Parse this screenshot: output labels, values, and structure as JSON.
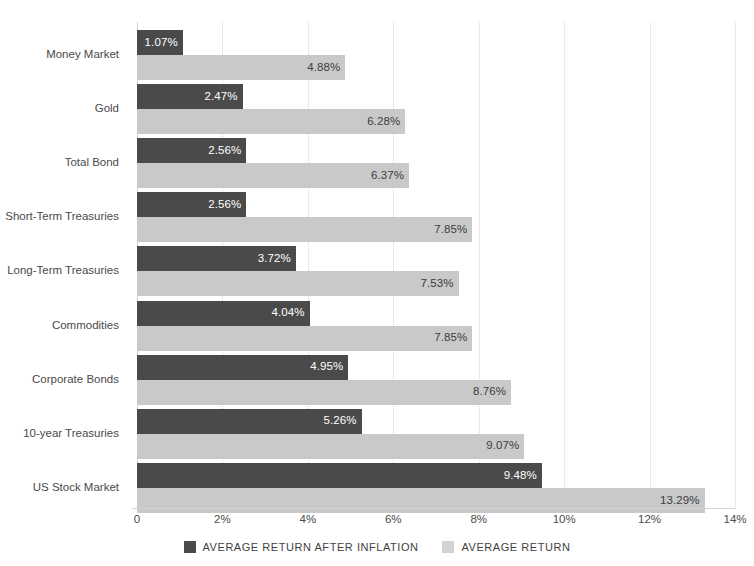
{
  "chart_data": {
    "type": "bar",
    "orientation": "horizontal",
    "title": "",
    "xlabel": "",
    "ylabel": "",
    "xlim": [
      0,
      14
    ],
    "xticks": [
      "0",
      "2%",
      "4%",
      "6%",
      "8%",
      "10%",
      "12%",
      "14%"
    ],
    "xtick_values": [
      0,
      2,
      4,
      6,
      8,
      10,
      12,
      14
    ],
    "grid": true,
    "grid_axis": "x",
    "legend_position": "bottom",
    "categories": [
      "Money Market",
      "Gold",
      "Total Bond",
      "Short-Term Treasuries",
      "Long-Term Treasuries",
      "Commodities",
      "Corporate Bonds",
      "10-year Treasuries",
      "US Stock Market"
    ],
    "series": [
      {
        "name": "AVERAGE RETURN AFTER INFLATION",
        "color": "#4a4a4a",
        "values": [
          1.07,
          2.47,
          2.56,
          2.56,
          3.72,
          4.04,
          4.95,
          5.26,
          9.48
        ],
        "labels": [
          "1.07%",
          "2.47%",
          "2.56%",
          "2.56%",
          "3.72%",
          "4.04%",
          "4.95%",
          "5.26%",
          "9.48%"
        ]
      },
      {
        "name": "AVERAGE RETURN",
        "color": "#c9c9c9",
        "values": [
          4.88,
          6.28,
          6.37,
          7.85,
          7.53,
          7.85,
          8.76,
          9.07,
          13.29
        ],
        "labels": [
          "4.88%",
          "6.28%",
          "6.37%",
          "7.85%",
          "7.53%",
          "7.85%",
          "8.76%",
          "9.07%",
          "13.29%"
        ]
      }
    ]
  },
  "legend": {
    "items": [
      {
        "label": "AVERAGE RETURN AFTER INFLATION",
        "swatch": "dark"
      },
      {
        "label": "AVERAGE RETURN",
        "swatch": "light"
      }
    ]
  },
  "colors": {
    "series_dark": "#4a4a4a",
    "series_light": "#c9c9c9",
    "grid": "#d6d6d6",
    "axis": "#d2d2d2",
    "text": "#4a4a4a",
    "background": "#ffffff"
  }
}
